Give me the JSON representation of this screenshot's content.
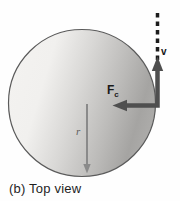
{
  "figure": {
    "caption": "(b) Top view",
    "labels": {
      "velocity": "v",
      "force_main": "F",
      "force_sub": "c",
      "radius": "r"
    },
    "colors": {
      "arrow_dark": "#4f4f4f",
      "arrow_radius": "#8a8a8a",
      "dashed_line": "#1c1c1c",
      "circle_stroke": "#5a5a5a",
      "disc_light": "#f3f2f0",
      "disc_dark": "#a5a4a2"
    }
  }
}
